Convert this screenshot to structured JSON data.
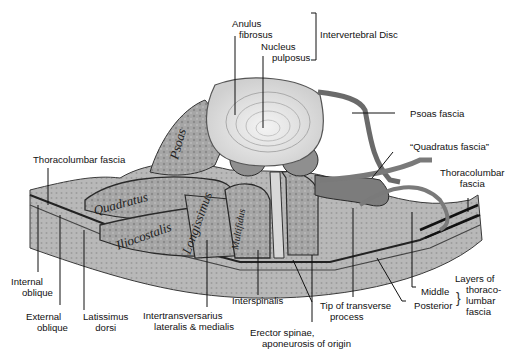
{
  "figure": {
    "colors": {
      "background": "#ffffff",
      "tissue_light": "#c9c9c9",
      "tissue_mid": "#9a9a9a",
      "tissue_dark": "#5a5a5a",
      "outline": "#2a2a2a",
      "disc": "#e4e4e4"
    },
    "muscle_inscriptions": [
      "Psoas",
      "Quadratus",
      "Iliocostalis",
      "Longissimus",
      "Multifidus"
    ],
    "labels": {
      "anulus_fibrosus": [
        "Anulus",
        "fibrosus"
      ],
      "nucleus_pulposus": [
        "Nucleus",
        "pulposus"
      ],
      "intervertebral_disc": "Intervertebral Disc",
      "psoas_fascia": "Psoas fascia",
      "quadratus_fascia": "“Quadratus fascia”",
      "thoracolumbar_fascia_left": "Thoracolumbar fascia",
      "thoracolumbar_fascia_right": [
        "Thoracolumbar",
        "fascia"
      ],
      "internal_oblique": [
        "Internal",
        "oblique"
      ],
      "external_oblique": [
        "External",
        "oblique"
      ],
      "latissimus_dorsi": [
        "Latissimus",
        "dorsi"
      ],
      "intertransversarius": [
        "Intertransversarius",
        "lateralis & medialis"
      ],
      "interspinalis": "Interspinalis",
      "tip_of_transverse_process": [
        "Tip of transverse",
        "process"
      ],
      "erector_spinae": [
        "Erector spinae,",
        "aponeurosis of origin"
      ],
      "middle": "Middle",
      "posterior": "Posterior",
      "layers_of_thoracolumbar_fascia": [
        "Layers of",
        "thoraco-",
        "lumbar",
        "fascia"
      ]
    }
  }
}
